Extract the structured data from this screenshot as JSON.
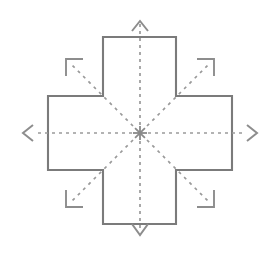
{
  "diagram": {
    "type": "schematic-line-drawing",
    "canvas": {
      "width": 274,
      "height": 255,
      "background": "#ffffff"
    },
    "colors": {
      "outline": "#7b7b7b",
      "dashed_line": "#9a9a9a",
      "arrow": "#8d8d8d",
      "bracket": "#8d8d8d",
      "hub": "#8a8a8a",
      "fill": "#ffffff"
    },
    "shape": {
      "name": "greek-cross",
      "outer_left": 48,
      "outer_right": 232,
      "outer_top": 37,
      "outer_bottom": 224,
      "arm_left": 103,
      "arm_right": 176,
      "arm_top": 96,
      "arm_bottom": 170,
      "points": "103,37 176,37 176,96 232,96 232,170 176,170 176,224 103,224 103,170 48,170 48,96 103,96",
      "stroke_width": 2.1
    },
    "center": {
      "x": 140,
      "y": 133,
      "label": "center-hub",
      "ray_count": 8,
      "ray_length": 7
    },
    "axis_arrows": [
      {
        "name": "arrow-up",
        "direction": "up",
        "line": "140,125 140,22",
        "head": "132,31 140,21 148,31"
      },
      {
        "name": "arrow-down",
        "direction": "down",
        "line": "140,141 140,232",
        "head": "132,224 140,235 148,224"
      },
      {
        "name": "arrow-left",
        "direction": "left",
        "line": "132,133 34,133",
        "head": "33,125 23,133 33,141"
      },
      {
        "name": "arrow-right",
        "direction": "right",
        "line": "148,133 246,133",
        "head": "247,125 257,133 247,141"
      }
    ],
    "diagonal_guides": [
      {
        "name": "guide-top-left",
        "direction": "up-left",
        "line": "133,126 71,64",
        "bracket": "66,76 66,59 83,59"
      },
      {
        "name": "guide-top-right",
        "direction": "up-right",
        "line": "147,126 209,64",
        "bracket": "197,59 214,59 214,76"
      },
      {
        "name": "guide-bottom-left",
        "direction": "down-left",
        "line": "133,140 71,202",
        "bracket": "66,190 66,207 83,207"
      },
      {
        "name": "guide-bottom-right",
        "direction": "down-right",
        "line": "147,140 209,202",
        "bracket": "197,207 214,207 214,190"
      }
    ]
  }
}
